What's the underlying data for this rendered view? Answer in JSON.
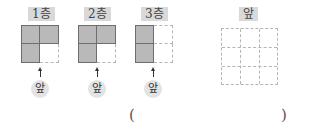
{
  "floors": [
    {
      "label": "1층",
      "cells": [
        true,
        true,
        true,
        false
      ],
      "front_label": "앞"
    },
    {
      "label": "2층",
      "cells": [
        true,
        true,
        true,
        false
      ],
      "front_label": "앞"
    },
    {
      "label": "3층",
      "cells": [
        true,
        false,
        true,
        false
      ],
      "front_label": "앞"
    }
  ],
  "answer_grid": {
    "label": "앞",
    "rows": 3,
    "cols": 3
  },
  "answer": {
    "open": "(",
    "close": ")",
    "value": ""
  },
  "colors": {
    "filled": "#b9b9b9",
    "filled_border": "#6e6e6e",
    "dashed": "#b5b5b5",
    "label_bg": "#d9d9d9"
  }
}
